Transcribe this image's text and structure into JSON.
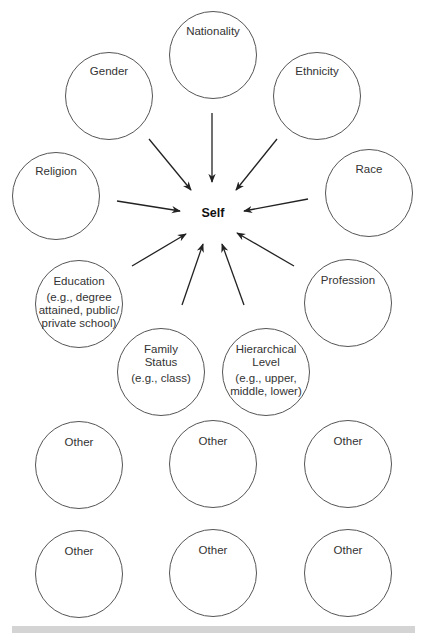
{
  "center": {
    "label": "Self"
  },
  "nodes": [
    {
      "id": "nationality",
      "lines": [
        "Nationality"
      ],
      "cx": 213,
      "cy": 55,
      "r": 44,
      "label_top": 24
    },
    {
      "id": "gender",
      "lines": [
        "Gender"
      ],
      "cx": 109,
      "cy": 96,
      "r": 44,
      "label_top": 64
    },
    {
      "id": "ethnicity",
      "lines": [
        "Ethnicity"
      ],
      "cx": 317,
      "cy": 96,
      "r": 44,
      "label_top": 64
    },
    {
      "id": "religion",
      "lines": [
        "Religion"
      ],
      "cx": 56,
      "cy": 196,
      "r": 44,
      "label_top": 164
    },
    {
      "id": "race",
      "lines": [
        "Race"
      ],
      "cx": 369,
      "cy": 193,
      "r": 44,
      "label_top": 162
    },
    {
      "id": "education",
      "lines": [
        "Education",
        "(e.g., degree",
        "attained, public/",
        "private school)"
      ],
      "cx": 79,
      "cy": 304,
      "r": 44,
      "label_top": 274
    },
    {
      "id": "family-status",
      "lines": [
        "Family",
        "Status",
        "(e.g., class)"
      ],
      "cx": 161,
      "cy": 372,
      "r": 44,
      "label_top": 342
    },
    {
      "id": "hierarchical-level",
      "lines": [
        "Hierarchical",
        "Level",
        "(e.g., upper,",
        "middle, lower)"
      ],
      "cx": 266,
      "cy": 372,
      "r": 44,
      "label_top": 342
    },
    {
      "id": "profession",
      "lines": [
        "Profession"
      ],
      "cx": 348,
      "cy": 303,
      "r": 44,
      "label_top": 273
    },
    {
      "id": "other-1",
      "lines": [
        "Other"
      ],
      "cx": 79,
      "cy": 465,
      "r": 44,
      "label_top": 435
    },
    {
      "id": "other-2",
      "lines": [
        "Other"
      ],
      "cx": 213,
      "cy": 464,
      "r": 44,
      "label_top": 434
    },
    {
      "id": "other-3",
      "lines": [
        "Other"
      ],
      "cx": 348,
      "cy": 464,
      "r": 44,
      "label_top": 434
    },
    {
      "id": "other-4",
      "lines": [
        "Other"
      ],
      "cx": 79,
      "cy": 574,
      "r": 44,
      "label_top": 544
    },
    {
      "id": "other-5",
      "lines": [
        "Other"
      ],
      "cx": 213,
      "cy": 573,
      "r": 44,
      "label_top": 543
    },
    {
      "id": "other-6",
      "lines": [
        "Other"
      ],
      "cx": 348,
      "cy": 573,
      "r": 44,
      "label_top": 543
    }
  ],
  "arrows": [
    {
      "from": "gender",
      "x1": 149,
      "y1": 139,
      "x2": 191,
      "y2": 190
    },
    {
      "from": "nationality",
      "x1": 212,
      "y1": 113,
      "x2": 212,
      "y2": 182
    },
    {
      "from": "ethnicity",
      "x1": 277,
      "y1": 139,
      "x2": 236,
      "y2": 190
    },
    {
      "from": "religion",
      "x1": 117,
      "y1": 201,
      "x2": 180,
      "y2": 211
    },
    {
      "from": "race",
      "x1": 308,
      "y1": 199,
      "x2": 244,
      "y2": 211
    },
    {
      "from": "education",
      "x1": 132,
      "y1": 266,
      "x2": 186,
      "y2": 234
    },
    {
      "from": "family-status",
      "x1": 182,
      "y1": 305,
      "x2": 203,
      "y2": 244
    },
    {
      "from": "hierarchical-level",
      "x1": 244,
      "y1": 305,
      "x2": 222,
      "y2": 244
    },
    {
      "from": "profession",
      "x1": 294,
      "y1": 266,
      "x2": 237,
      "y2": 233
    }
  ],
  "colors": {
    "stroke": "#555555",
    "arrow": "#222222",
    "text": "#333333",
    "strip": "#d4d4d4"
  }
}
